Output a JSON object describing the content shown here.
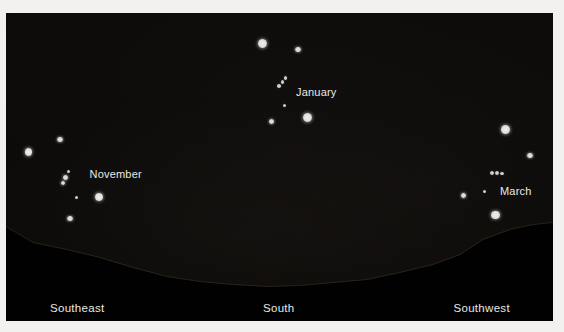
{
  "figure_type": "star-chart",
  "colors": {
    "margin": "#f2f1ef",
    "sky": "#0b0a09",
    "ground": "#010101",
    "ridge_highlight": "rgba(86,69,50,0.38)",
    "star_bright": "#e6e5e1",
    "star_medium": "#d8d7d3",
    "star_dim": "#c9c8c4",
    "label_text": "#eae9e6"
  },
  "star_groups": [
    {
      "id": "november",
      "label": {
        "text": "November",
        "x": 89.5,
        "y": 173.5
      },
      "stars": [
        {
          "x": 60,
          "y": 139.5,
          "d": 5.5,
          "tier": "med"
        },
        {
          "x": 28.5,
          "y": 152,
          "d": 7.5,
          "tier": "bright"
        },
        {
          "x": 68.5,
          "y": 171.5,
          "d": 3.5,
          "tier": "dim"
        },
        {
          "x": 65.5,
          "y": 177.5,
          "d": 4.5,
          "tier": "med"
        },
        {
          "x": 63,
          "y": 183,
          "d": 4.5,
          "tier": "med"
        },
        {
          "x": 76,
          "y": 197.5,
          "d": 3,
          "tier": "dim"
        },
        {
          "x": 99,
          "y": 196.5,
          "d": 8,
          "tier": "bright"
        },
        {
          "x": 70,
          "y": 218.5,
          "d": 5.5,
          "tier": "med"
        }
      ]
    },
    {
      "id": "january",
      "label": {
        "text": "January",
        "x": 296,
        "y": 91.5
      },
      "stars": [
        {
          "x": 262.5,
          "y": 43.5,
          "d": 9,
          "tier": "bright"
        },
        {
          "x": 298,
          "y": 49.5,
          "d": 5.5,
          "tier": "med"
        },
        {
          "x": 285.5,
          "y": 78,
          "d": 3.5,
          "tier": "dim"
        },
        {
          "x": 282.5,
          "y": 82,
          "d": 3.5,
          "tier": "dim"
        },
        {
          "x": 279,
          "y": 86,
          "d": 3.5,
          "tier": "dim"
        },
        {
          "x": 284.5,
          "y": 105.5,
          "d": 3,
          "tier": "dim"
        },
        {
          "x": 307.5,
          "y": 117.5,
          "d": 9,
          "tier": "bright"
        },
        {
          "x": 271.5,
          "y": 121.5,
          "d": 5,
          "tier": "med"
        }
      ]
    },
    {
      "id": "march",
      "label": {
        "text": "March",
        "x": 500,
        "y": 190.5
      },
      "stars": [
        {
          "x": 505.5,
          "y": 129.5,
          "d": 8.5,
          "tier": "bright"
        },
        {
          "x": 530,
          "y": 155.5,
          "d": 5.5,
          "tier": "med"
        },
        {
          "x": 492,
          "y": 172.5,
          "d": 4,
          "tier": "dim"
        },
        {
          "x": 497,
          "y": 173,
          "d": 4,
          "tier": "dim"
        },
        {
          "x": 502,
          "y": 173.5,
          "d": 3.5,
          "tier": "dim"
        },
        {
          "x": 484.5,
          "y": 191.5,
          "d": 3,
          "tier": "dim"
        },
        {
          "x": 463.5,
          "y": 195.5,
          "d": 4.5,
          "tier": "med"
        },
        {
          "x": 495.5,
          "y": 215,
          "d": 8.5,
          "tier": "bright"
        }
      ]
    }
  ],
  "horizon": {
    "labels": [
      {
        "text": "Southeast",
        "x": 50,
        "y": 307.5
      },
      {
        "text": "South",
        "x": 263,
        "y": 307.5
      },
      {
        "text": "Southwest",
        "x": 453.5,
        "y": 307.5
      }
    ],
    "points": [
      [
        6,
        227
      ],
      [
        33,
        243
      ],
      [
        67,
        250
      ],
      [
        100,
        258
      ],
      [
        133,
        268
      ],
      [
        167,
        277
      ],
      [
        200,
        282
      ],
      [
        233,
        285
      ],
      [
        267,
        287
      ],
      [
        300,
        286
      ],
      [
        333,
        283
      ],
      [
        367,
        280
      ],
      [
        400,
        273
      ],
      [
        433,
        265
      ],
      [
        460,
        255
      ],
      [
        483,
        240
      ],
      [
        510,
        230
      ],
      [
        533,
        225
      ],
      [
        553,
        223
      ]
    ]
  }
}
